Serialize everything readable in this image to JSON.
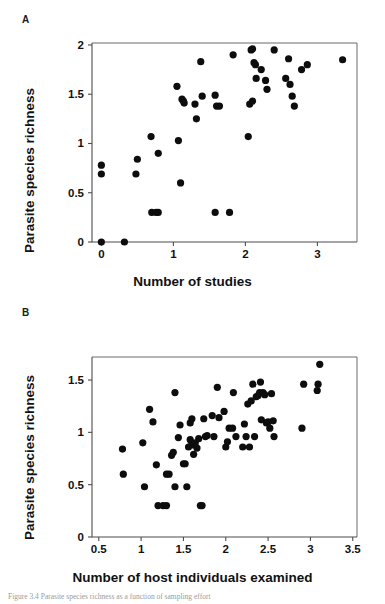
{
  "figure": {
    "panel_a_label": "A",
    "panel_b_label": "B",
    "caption": "Figure 3.4  Parasite species richness as a function of sampling effort"
  },
  "chart_data": [
    {
      "type": "scatter",
      "panel": "A",
      "title": "",
      "xlabel": "Number of studies",
      "ylabel": "Parasite species richness",
      "xlim": [
        -0.13,
        3.55
      ],
      "ylim": [
        0,
        2.02
      ],
      "xticks": [
        0,
        1,
        2,
        3
      ],
      "xtick_labels": [
        "0",
        "1",
        "2",
        "3"
      ],
      "yticks": [
        0,
        0.5,
        1,
        1.5,
        2
      ],
      "ytick_labels": [
        "0",
        "0.5",
        "1",
        "1.5",
        "2"
      ],
      "grid": false,
      "legend": "none",
      "marker": "filled-circle",
      "marker_color": "#0d0d0d",
      "points": [
        [
          0.0,
          0.0
        ],
        [
          0.0,
          0.69
        ],
        [
          0.0,
          0.78
        ],
        [
          0.32,
          0.0
        ],
        [
          0.48,
          0.69
        ],
        [
          0.5,
          0.84
        ],
        [
          0.69,
          1.07
        ],
        [
          0.7,
          0.3
        ],
        [
          0.76,
          0.3
        ],
        [
          0.79,
          0.3
        ],
        [
          0.79,
          0.9
        ],
        [
          1.05,
          1.58
        ],
        [
          1.07,
          1.03
        ],
        [
          1.1,
          0.6
        ],
        [
          1.12,
          1.45
        ],
        [
          1.14,
          1.43
        ],
        [
          1.15,
          1.41
        ],
        [
          1.3,
          1.4
        ],
        [
          1.32,
          1.25
        ],
        [
          1.38,
          1.83
        ],
        [
          1.4,
          1.48
        ],
        [
          1.58,
          0.3
        ],
        [
          1.58,
          1.49
        ],
        [
          1.6,
          1.38
        ],
        [
          1.64,
          1.38
        ],
        [
          1.78,
          0.3
        ],
        [
          1.83,
          1.9
        ],
        [
          2.04,
          1.07
        ],
        [
          2.06,
          1.4
        ],
        [
          2.08,
          1.95
        ],
        [
          2.1,
          1.43
        ],
        [
          2.1,
          1.96
        ],
        [
          2.12,
          1.82
        ],
        [
          2.14,
          1.8
        ],
        [
          2.15,
          1.66
        ],
        [
          2.22,
          1.75
        ],
        [
          2.28,
          1.64
        ],
        [
          2.3,
          1.55
        ],
        [
          2.4,
          1.95
        ],
        [
          2.56,
          1.66
        ],
        [
          2.6,
          1.86
        ],
        [
          2.62,
          1.6
        ],
        [
          2.65,
          1.48
        ],
        [
          2.68,
          1.38
        ],
        [
          2.78,
          1.75
        ],
        [
          2.86,
          1.8
        ],
        [
          3.35,
          1.85
        ]
      ]
    },
    {
      "type": "scatter",
      "panel": "B",
      "title": "",
      "xlabel": "Number of host individuals examined",
      "ylabel": "Parasite species richness",
      "xlim": [
        0.42,
        3.55
      ],
      "ylim": [
        0,
        1.72
      ],
      "xticks": [
        0.5,
        1,
        1.5,
        2,
        2.5,
        3,
        3.5
      ],
      "xtick_labels": [
        "0.5",
        "1",
        "1.5",
        "2",
        "2.5",
        "3",
        "3.5"
      ],
      "yticks": [
        0,
        0.5,
        1,
        1.5
      ],
      "ytick_labels": [
        "0",
        "0.5",
        "1",
        "1.5"
      ],
      "grid": false,
      "legend": "none",
      "marker": "filled-circle",
      "marker_color": "#0d0d0d",
      "points": [
        [
          0.78,
          0.84
        ],
        [
          0.79,
          0.6
        ],
        [
          1.02,
          0.9
        ],
        [
          1.04,
          0.48
        ],
        [
          1.1,
          1.22
        ],
        [
          1.14,
          1.1
        ],
        [
          1.18,
          0.69
        ],
        [
          1.2,
          0.3
        ],
        [
          1.26,
          0.3
        ],
        [
          1.3,
          0.3
        ],
        [
          1.3,
          0.6
        ],
        [
          1.33,
          0.6
        ],
        [
          1.36,
          0.78
        ],
        [
          1.38,
          0.81
        ],
        [
          1.4,
          0.48
        ],
        [
          1.4,
          1.38
        ],
        [
          1.44,
          0.95
        ],
        [
          1.46,
          1.07
        ],
        [
          1.5,
          0.7
        ],
        [
          1.52,
          0.7
        ],
        [
          1.54,
          0.48
        ],
        [
          1.56,
          0.86
        ],
        [
          1.58,
          0.93
        ],
        [
          1.58,
          1.09
        ],
        [
          1.6,
          0.9
        ],
        [
          1.6,
          1.13
        ],
        [
          1.62,
          0.88
        ],
        [
          1.62,
          0.79
        ],
        [
          1.64,
          0.9
        ],
        [
          1.66,
          0.85
        ],
        [
          1.68,
          0.94
        ],
        [
          1.7,
          0.3
        ],
        [
          1.72,
          0.3
        ],
        [
          1.74,
          1.13
        ],
        [
          1.76,
          0.96
        ],
        [
          1.78,
          0.97
        ],
        [
          1.84,
          1.16
        ],
        [
          1.86,
          0.96
        ],
        [
          1.9,
          1.43
        ],
        [
          1.92,
          1.14
        ],
        [
          1.98,
          1.2
        ],
        [
          2.0,
          0.86
        ],
        [
          2.02,
          0.91
        ],
        [
          2.04,
          1.04
        ],
        [
          2.08,
          1.04
        ],
        [
          2.09,
          1.38
        ],
        [
          2.12,
          0.96
        ],
        [
          2.2,
          0.86
        ],
        [
          2.22,
          1.08
        ],
        [
          2.24,
          0.96
        ],
        [
          2.26,
          1.27
        ],
        [
          2.28,
          0.86
        ],
        [
          2.3,
          1.3
        ],
        [
          2.32,
          1.46
        ],
        [
          2.34,
          0.96
        ],
        [
          2.36,
          1.34
        ],
        [
          2.38,
          1.35
        ],
        [
          2.4,
          1.38
        ],
        [
          2.41,
          1.48
        ],
        [
          2.42,
          1.12
        ],
        [
          2.44,
          1.38
        ],
        [
          2.46,
          1.36
        ],
        [
          2.48,
          1.09
        ],
        [
          2.5,
          1.1
        ],
        [
          2.52,
          1.04
        ],
        [
          2.54,
          1.37
        ],
        [
          2.56,
          1.11
        ],
        [
          2.57,
          0.96
        ],
        [
          2.9,
          1.04
        ],
        [
          2.92,
          1.46
        ],
        [
          3.08,
          1.4
        ],
        [
          3.09,
          1.46
        ],
        [
          3.11,
          1.65
        ]
      ]
    }
  ]
}
